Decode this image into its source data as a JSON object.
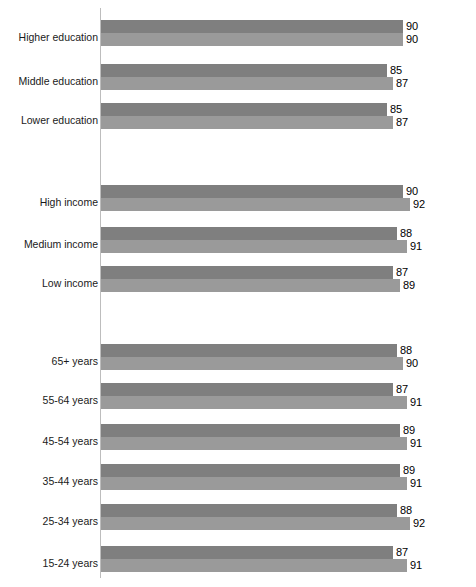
{
  "chart_data": {
    "type": "bar",
    "orientation": "horizontal",
    "title": "",
    "subtitle": "",
    "xlabel": "",
    "ylabel": "",
    "xlim": [
      0,
      100
    ],
    "grid": false,
    "legend": "none",
    "axis_line_color": "#bdbdbd",
    "series": [
      {
        "name": "series-1",
        "color": "#7f7f7f",
        "values": [
          90,
          85,
          85,
          90,
          88,
          87,
          88,
          87,
          89,
          89,
          88,
          87
        ]
      },
      {
        "name": "series-2",
        "color": "#9a9a9a",
        "values": [
          90,
          87,
          87,
          92,
          91,
          89,
          90,
          91,
          91,
          91,
          92,
          91
        ]
      }
    ],
    "categories": [
      "Higher education",
      "Middle education",
      "Lower education",
      "High income",
      "Medium income",
      "Low income",
      "65+ years",
      "55-64 years",
      "45-54 years",
      "35-44 years",
      "25-34 years",
      "15-24 years"
    ],
    "sections": [
      {
        "name": "education",
        "categories": [
          "Higher education",
          "Middle education",
          "Lower education"
        ]
      },
      {
        "name": "income",
        "categories": [
          "High income",
          "Medium income",
          "Low income"
        ]
      },
      {
        "name": "age",
        "categories": [
          "65+ years",
          "55-64 years",
          "45-54 years",
          "35-44 years",
          "25-34 years",
          "15-24 years"
        ]
      }
    ]
  },
  "groups": [
    {
      "label": "Higher education",
      "v1": 90,
      "v2": 90,
      "top": 20,
      "label_top": 31
    },
    {
      "label": "Middle education",
      "v1": 85,
      "v2": 87,
      "top": 64,
      "label_top": 75
    },
    {
      "label": "Lower education",
      "v1": 85,
      "v2": 87,
      "top": 103,
      "label_top": 114
    },
    {
      "label": "High income",
      "v1": 90,
      "v2": 92,
      "top": 185,
      "label_top": 196
    },
    {
      "label": "Medium income",
      "v1": 88,
      "v2": 91,
      "top": 227,
      "label_top": 238
    },
    {
      "label": "Low income",
      "v1": 87,
      "v2": 89,
      "top": 266,
      "label_top": 277
    },
    {
      "label": "65+ years",
      "v1": 88,
      "v2": 90,
      "top": 344,
      "label_top": 355
    },
    {
      "label": "55-64 years",
      "v1": 87,
      "v2": 91,
      "top": 383,
      "label_top": 394
    },
    {
      "label": "45-54 years",
      "v1": 89,
      "v2": 91,
      "top": 424,
      "label_top": 435
    },
    {
      "label": "35-44 years",
      "v1": 89,
      "v2": 91,
      "top": 464,
      "label_top": 475
    },
    {
      "label": "25-34 years",
      "v1": 88,
      "v2": 92,
      "top": 504,
      "label_top": 515
    },
    {
      "label": "15-24 years",
      "v1": 87,
      "v2": 91,
      "top": 546,
      "label_top": 557
    }
  ]
}
